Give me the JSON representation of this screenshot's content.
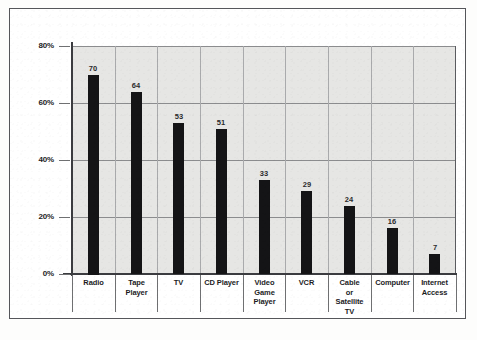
{
  "chart_data": {
    "type": "bar",
    "title": "",
    "subtitle": "",
    "xlabel": "",
    "ylabel": "",
    "ylim": [
      0,
      80
    ],
    "ytick_labels": [
      "0%",
      "20%",
      "40%",
      "60%",
      "80%"
    ],
    "ytick_values": [
      0,
      20,
      40,
      60,
      80
    ],
    "grid": true,
    "legend": "none",
    "categories": [
      "Radio",
      "Tape Player",
      "TV",
      "CD Player",
      "Video Game Player",
      "VCR",
      "Cable or Satellite TV",
      "Computer",
      "Internet Access"
    ],
    "category_lines": [
      [
        "Radio"
      ],
      [
        "Tape",
        "Player"
      ],
      [
        "TV"
      ],
      [
        "CD Player"
      ],
      [
        "Video",
        "Game",
        "Player"
      ],
      [
        "VCR"
      ],
      [
        "Cable",
        "or",
        "Satellite",
        "TV"
      ],
      [
        "Computer"
      ],
      [
        "Internet",
        "Access"
      ]
    ],
    "values": [
      70,
      64,
      53,
      51,
      33,
      29,
      24,
      16,
      7
    ],
    "value_labels": [
      "70",
      "64",
      "53",
      "51",
      "33",
      "29",
      "24",
      "16",
      "7"
    ],
    "bar_color": "#141416",
    "plot_background": "#e6e6e4",
    "gridline_color": "#8b8c8e"
  }
}
